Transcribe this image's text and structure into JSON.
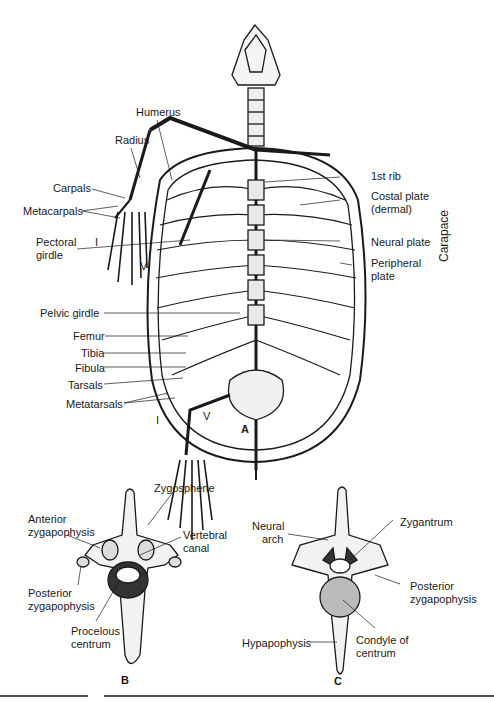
{
  "figure_a": {
    "letter": "A",
    "left_labels": {
      "humerus": "Humerus",
      "radius": "Radius",
      "carpals": "Carpals",
      "metacarpals": "Metacarpals",
      "pectoral_girdle_1": "Pectoral",
      "pectoral_girdle_2": "girdle",
      "pelvic_girdle": "Pelvic girdle",
      "femur": "Femur",
      "tibia": "Tibia",
      "fibula": "Fibula",
      "tarsals": "Tarsals",
      "metatarsals": "Metatarsals"
    },
    "right_labels": {
      "first_rib": "1st rib",
      "costal_plate_1": "Costal plate",
      "costal_plate_2": "(dermal)",
      "neural_plate": "Neural plate",
      "peripheral_plate_1": "Peripheral",
      "peripheral_plate_2": "plate"
    },
    "group_label": "Carapace",
    "digit_labels": {
      "first": "I",
      "fifth": "V"
    }
  },
  "figure_b": {
    "letter": "B",
    "labels": {
      "zygosphene": "Zygosphene",
      "anterior_zyg_1": "Anterior",
      "anterior_zyg_2": "zygapophysis",
      "vertebral_canal_1": "Vertebral",
      "vertebral_canal_2": "canal",
      "posterior_zyg_1": "Posterior",
      "posterior_zyg_2": "zygapophysis",
      "procelous_1": "Procelous",
      "procelous_2": "centrum"
    }
  },
  "figure_c": {
    "letter": "C",
    "labels": {
      "neural_arch_1": "Neural",
      "neural_arch_2": "arch",
      "zygantrum": "Zygantrum",
      "posterior_zyg_1": "Posterior",
      "posterior_zyg_2": "zygapophysis",
      "hypapophysis": "Hypapophysis",
      "condyle_1": "Condyle of",
      "condyle_2": "centrum"
    }
  }
}
